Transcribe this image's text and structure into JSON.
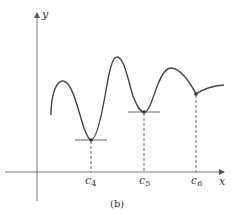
{
  "figure": {
    "caption": "(b)",
    "axes": {
      "x_label": "x",
      "y_label": "y"
    },
    "critical_points": [
      {
        "label": "c",
        "subscript": "4",
        "type": "local-min-horizontal-tangent"
      },
      {
        "label": "c",
        "subscript": "5",
        "type": "local-min-horizontal-tangent"
      },
      {
        "label": "c",
        "subscript": "6",
        "type": "corner-point"
      }
    ],
    "colors": {
      "curve": "#444444",
      "axes": "#666666",
      "background": "#ffffff"
    }
  }
}
